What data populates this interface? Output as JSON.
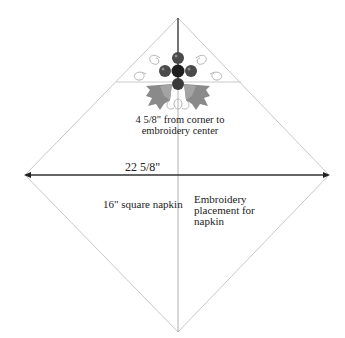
{
  "diagram": {
    "title": "Embroidery placement for napkin",
    "labels": {
      "distance_line1": "4 5/8\" from corner to",
      "distance_line2": "embroidery center",
      "width": "22 5/8\"",
      "napkin_size": "16\" square napkin",
      "placement_line1": "Embroidery",
      "placement_line2": "placement for",
      "placement_line3": "napkin"
    },
    "shape": {
      "type": "square-rotated-45",
      "corners": {
        "top": [
          178,
          18
        ],
        "right": [
          329,
          175
        ],
        "bottom": [
          178,
          332
        ],
        "left": [
          25,
          175
        ]
      }
    },
    "colors": {
      "outline": "#c8c8c8",
      "dimension_arrow": "#333333",
      "center_line": "#555555",
      "berry_dark": "#1e1e1e",
      "berry_mid": "#4a4a4a",
      "leaf": "#8a8a8a",
      "swirl": "#b5b5b5",
      "text": "#222222"
    },
    "motif": {
      "name": "holly-berry-embroidery",
      "center": [
        178,
        72
      ]
    }
  }
}
